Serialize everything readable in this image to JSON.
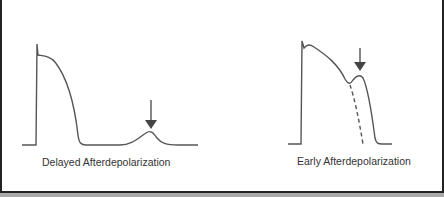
{
  "figure": {
    "panels": [
      {
        "id": "delayed",
        "caption": "Delayed Afterdepolarization",
        "trace": "action potential returns fully to baseline, followed by a small afterdepolarization bump",
        "arrow_target": "afterdepolarization bump during diastole"
      },
      {
        "id": "early",
        "caption": "Early Afterdepolarization",
        "trace": "action potential with secondary depolarization during repolarization; dashed line shows normal repolarization",
        "arrow_target": "afterdepolarization hump during phase 3"
      }
    ],
    "colors": {
      "trace": "#555555",
      "arrow": "#444444",
      "background": "#ffffff",
      "border": "#222222"
    }
  }
}
